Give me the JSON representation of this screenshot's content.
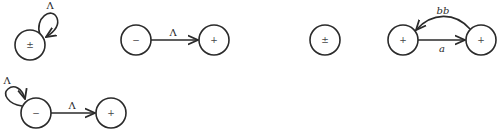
{
  "diagram": {
    "graphs": [
      {
        "id": "g1",
        "nodes": [
          {
            "id": "g1n1",
            "sign": "±",
            "cx": 30,
            "cy": 45
          }
        ],
        "edges": [
          {
            "from": "g1n1",
            "to": "g1n1",
            "label": "Λ",
            "type": "self-loop"
          }
        ]
      },
      {
        "id": "g2",
        "nodes": [
          {
            "id": "g2n1",
            "sign": "−",
            "cx": 136,
            "cy": 40
          },
          {
            "id": "g2n2",
            "sign": "+",
            "cx": 214,
            "cy": 40
          }
        ],
        "edges": [
          {
            "from": "g2n1",
            "to": "g2n2",
            "label": "Λ",
            "type": "straight"
          }
        ]
      },
      {
        "id": "g3",
        "nodes": [
          {
            "id": "g3n1",
            "sign": "±",
            "cx": 325,
            "cy": 40
          }
        ],
        "edges": []
      },
      {
        "id": "g4",
        "nodes": [
          {
            "id": "g4n1",
            "sign": "+",
            "cx": 403,
            "cy": 40
          },
          {
            "id": "g4n2",
            "sign": "+",
            "cx": 481,
            "cy": 40
          }
        ],
        "edges": [
          {
            "from": "g4n1",
            "to": "g4n2",
            "label": "a",
            "type": "straight"
          },
          {
            "from": "g4n2",
            "to": "g4n1",
            "label": "bb",
            "type": "curved"
          }
        ]
      },
      {
        "id": "g5",
        "nodes": [
          {
            "id": "g5n1",
            "sign": "−",
            "cx": 36,
            "cy": 113
          },
          {
            "id": "g5n2",
            "sign": "+",
            "cx": 111,
            "cy": 113
          }
        ],
        "edges": [
          {
            "from": "g5n1",
            "to": "g5n1",
            "label": "Λ",
            "type": "self-loop"
          },
          {
            "from": "g5n1",
            "to": "g5n2",
            "label": "Λ",
            "type": "straight"
          }
        ]
      }
    ],
    "labels": {
      "g1_loop": "Λ",
      "g2_edge": "Λ",
      "g4_a": "a",
      "g4_bb": "bb",
      "g5_loop": "Λ",
      "g5_edge": "Λ"
    },
    "signs": {
      "g1n1": "±",
      "g2n1": "−",
      "g2n2": "+",
      "g3n1": "±",
      "g4n1": "+",
      "g4n2": "+",
      "g5n1": "−",
      "g5n2": "+"
    },
    "colors": {
      "stroke": "#2a2a2a",
      "background": "#ffffff"
    }
  }
}
